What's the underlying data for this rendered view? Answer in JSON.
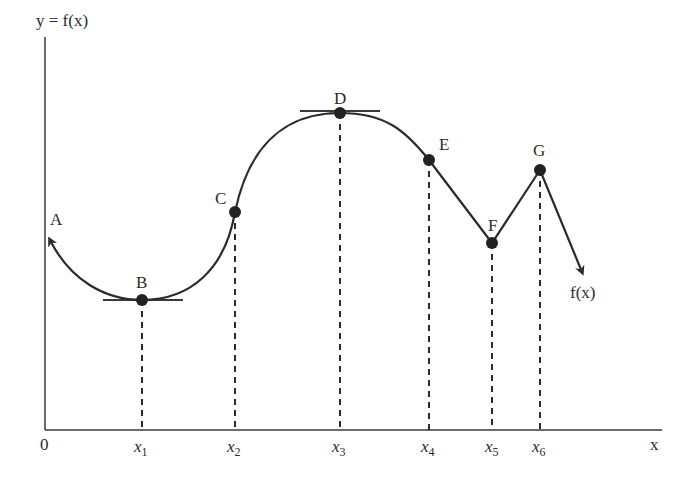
{
  "diagram": {
    "y_axis_label": "y = f(x)",
    "x_axis_label": "x",
    "origin_label": "0",
    "curve_label": "f(x)",
    "colors": {
      "curve": "#2b2b2b",
      "axis": "#3a3a3a",
      "background": "#ffffff"
    },
    "points": [
      {
        "label": "A",
        "description": "curve continues (arrow, left end)"
      },
      {
        "label": "B",
        "description": "local minimum, horizontal tangent",
        "x_tick": "x1"
      },
      {
        "label": "C",
        "description": "point on rising curve",
        "x_tick": "x2"
      },
      {
        "label": "D",
        "description": "local maximum, horizontal tangent",
        "x_tick": "x3"
      },
      {
        "label": "E",
        "description": "point where curve becomes straight",
        "x_tick": "x4"
      },
      {
        "label": "F",
        "description": "corner local minimum",
        "x_tick": "x5"
      },
      {
        "label": "G",
        "description": "corner local maximum",
        "x_tick": "x6"
      }
    ],
    "x_ticks": [
      {
        "base": "x",
        "sub": "1"
      },
      {
        "base": "x",
        "sub": "2"
      },
      {
        "base": "x",
        "sub": "3"
      },
      {
        "base": "x",
        "sub": "4"
      },
      {
        "base": "x",
        "sub": "5"
      },
      {
        "base": "x",
        "sub": "6"
      }
    ]
  }
}
